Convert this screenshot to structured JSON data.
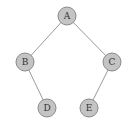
{
  "diagram": {
    "type": "binary-tree",
    "colors": {
      "node_fill": "#c4c4c4",
      "node_stroke": "#8a8a8a",
      "edge": "#9a9a9a",
      "label": "#333333",
      "background": "#ffffff"
    },
    "nodes": [
      {
        "id": "A",
        "label": "A",
        "x": 67,
        "y": 16
      },
      {
        "id": "B",
        "label": "B",
        "x": 25,
        "y": 62
      },
      {
        "id": "C",
        "label": "C",
        "x": 112,
        "y": 62
      },
      {
        "id": "D",
        "label": "D",
        "x": 47,
        "y": 108
      },
      {
        "id": "E",
        "label": "E",
        "x": 89,
        "y": 108
      }
    ],
    "edges": [
      {
        "from": "A",
        "to": "B"
      },
      {
        "from": "A",
        "to": "C"
      },
      {
        "from": "B",
        "to": "D"
      },
      {
        "from": "C",
        "to": "E"
      }
    ]
  }
}
